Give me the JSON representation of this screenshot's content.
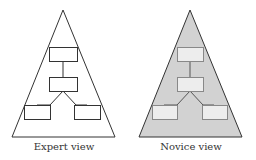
{
  "figure": {
    "panels": [
      {
        "id": "expert",
        "caption": "Expert view",
        "triangle_fill": "#ffffff",
        "box_fill": "#ffffff",
        "stroke": "#333333"
      },
      {
        "id": "novice",
        "caption": "Novice view",
        "triangle_fill": "#d2d2d2",
        "box_fill": "#ededed",
        "stroke": "#333333"
      }
    ],
    "structure": {
      "shape": "triangle",
      "nodes": [
        "top-box",
        "middle-box",
        "bottom-left-box",
        "bottom-right-box"
      ],
      "edges": [
        [
          "top-box",
          "middle-box"
        ],
        [
          "middle-box",
          "bottom-left-box"
        ],
        [
          "middle-box",
          "bottom-right-box"
        ]
      ]
    }
  }
}
